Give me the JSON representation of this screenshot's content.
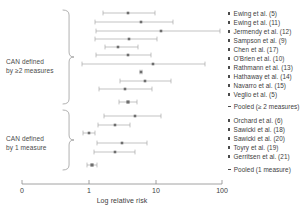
{
  "figure": {
    "axis": {
      "label": "Log relative risk",
      "ticks": [
        {
          "text": "0",
          "x": 22
        },
        {
          "text": "1",
          "x": 89
        },
        {
          "text": "10",
          "x": 156
        },
        {
          "text": "100",
          "x": 222
        }
      ],
      "line": {
        "x1": 22,
        "x2": 222,
        "y": 184
      },
      "tick_height": 4,
      "color": "#8a8a8a"
    },
    "groups": [
      {
        "id": "can-2-measures",
        "label": "CAN defined\nby ≥2 measures",
        "label_x": 6,
        "label_y": 58,
        "brace": {
          "x": 63,
          "y_top": 10,
          "y_bottom": 104,
          "width": 11
        }
      },
      {
        "id": "can-1-measure",
        "label": "CAN defined\nby 1 measure",
        "label_x": 6,
        "label_y": 135,
        "brace": {
          "x": 63,
          "y_top": 110,
          "y_bottom": 170,
          "width": 11
        }
      }
    ],
    "legend": [
      {
        "text": "Ewing et al. (5)",
        "y": 10,
        "type": "study"
      },
      {
        "text": "Ewing et al. (11)",
        "y": 19,
        "type": "study"
      },
      {
        "text": "Jermendy et al. (12)",
        "y": 28,
        "type": "study"
      },
      {
        "text": "Sampson et al. (9)",
        "y": 37,
        "type": "study"
      },
      {
        "text": "Chen et al. (17)",
        "y": 46,
        "type": "study"
      },
      {
        "text": "O'Brien et al. (10)",
        "y": 55,
        "type": "study"
      },
      {
        "text": "Rathmann et al. (13)",
        "y": 64,
        "type": "study"
      },
      {
        "text": "Hathaway et al. (14)",
        "y": 73,
        "type": "study"
      },
      {
        "text": "Navarro et al. (15)",
        "y": 82,
        "type": "study"
      },
      {
        "text": "Veglio et al. (5)",
        "y": 91,
        "type": "study"
      },
      {
        "text": "Pooled (≥ 2 measures)",
        "y": 103,
        "type": "pooled"
      },
      {
        "text": "Orchard et al. (6)",
        "y": 117,
        "type": "study"
      },
      {
        "text": "Sawicki et al. (18)",
        "y": 126,
        "type": "study"
      },
      {
        "text": "Sawicki et al. (20)",
        "y": 135,
        "type": "study"
      },
      {
        "text": "Toyry et al. (19)",
        "y": 144,
        "type": "study"
      },
      {
        "text": "Gerritsen et al. (21)",
        "y": 153,
        "type": "study"
      },
      {
        "text": "Pooled (1 measure)",
        "y": 166,
        "type": "pooled"
      }
    ]
  },
  "chart_data": {
    "type": "forest",
    "title": "",
    "xlabel": "Log relative risk",
    "ylabel": "",
    "xscale": "log",
    "xlim": [
      0,
      100
    ],
    "xticks": [
      0,
      1,
      10,
      100
    ],
    "grid": false,
    "legend_position": "right",
    "marker_color": "#6e6e6e",
    "line_color": "#9a9a9a",
    "rows": [
      {
        "label": "Ewing et al. (5)",
        "group": "can-2-measures",
        "y": 13,
        "estimate_px": 128,
        "low_px": 103,
        "high_px": 155,
        "estimate": 3.6,
        "low": 1.6,
        "high": 8.3
      },
      {
        "label": "Ewing et al. (11)",
        "group": "can-2-measures",
        "y": 22,
        "estimate_px": 141,
        "low_px": 95,
        "high_px": 173,
        "estimate": 5.9,
        "low": 1.3,
        "high": 16.2
      },
      {
        "label": "Jermendy et al. (12)",
        "group": "can-2-measures",
        "y": 31,
        "estimate_px": 161,
        "low_px": 96,
        "high_px": 220,
        "estimate": 12.5,
        "low": 1.3,
        "high": 94.0
      },
      {
        "label": "Sampson et al. (9)",
        "group": "can-2-measures",
        "y": 39,
        "estimate_px": 129,
        "low_px": 95,
        "high_px": 157,
        "estimate": 3.8,
        "low": 1.3,
        "high": 9.1
      },
      {
        "label": "Chen et al. (17)",
        "group": "can-2-measures",
        "y": 47,
        "estimate_px": 118,
        "low_px": 105,
        "high_px": 138,
        "estimate": 2.6,
        "low": 1.8,
        "high": 5.3
      },
      {
        "label": "O'Brien et al. (10)",
        "group": "can-2-measures",
        "y": 55,
        "estimate_px": 128,
        "low_px": 96,
        "high_px": 151,
        "estimate": 3.6,
        "low": 1.3,
        "high": 7.5
      },
      {
        "label": "Rathmann et al. (13)",
        "group": "can-2-measures",
        "y": 64,
        "estimate_px": 153,
        "low_px": 82,
        "high_px": 205,
        "estimate": 9.5,
        "low": 0.8,
        "high": 55.0
      },
      {
        "label": "Hathaway et al. (14)",
        "group": "can-2-measures",
        "y": 72,
        "estimate_px": 141,
        "low_px": 140,
        "high_px": 142,
        "estimate": 5.9,
        "low": 5.8,
        "high": 6.0
      },
      {
        "label": "Navarro et al. (15)",
        "group": "can-2-measures",
        "y": 81,
        "estimate_px": 145,
        "low_px": 120,
        "high_px": 171,
        "estimate": 6.9,
        "low": 2.9,
        "high": 15.3
      },
      {
        "label": "Veglio et al. (5)",
        "group": "can-2-measures",
        "y": 89,
        "estimate_px": 125,
        "low_px": 99,
        "high_px": 152,
        "estimate": 3.2,
        "low": 1.4,
        "high": 7.8
      },
      {
        "label": "Pooled (≥ 2 measures)",
        "group": "can-2-measures",
        "y": 102,
        "estimate_px": 128,
        "low_px": 119,
        "high_px": 137,
        "estimate": 3.6,
        "low": 2.8,
        "high": 5.2,
        "pooled": true
      },
      {
        "label": "Orchard et al. (6)",
        "group": "can-1-measure",
        "y": 116,
        "estimate_px": 135,
        "low_px": 104,
        "high_px": 161,
        "estimate": 4.7,
        "low": 1.7,
        "high": 11.0
      },
      {
        "label": "Sawicki et al. (18)",
        "group": "can-1-measure",
        "y": 125,
        "estimate_px": 115,
        "low_px": 98,
        "high_px": 130,
        "estimate": 2.4,
        "low": 1.4,
        "high": 3.8
      },
      {
        "label": "Sawicki et al. (20)",
        "group": "can-1-measure",
        "y": 133,
        "estimate_px": 89,
        "low_px": 83,
        "high_px": 95,
        "estimate": 1.0,
        "low": 0.8,
        "high": 1.2
      },
      {
        "label": "Toyry et al. (19)",
        "group": "can-1-measure",
        "y": 143,
        "estimate_px": 122,
        "low_px": 97,
        "high_px": 147,
        "estimate": 3.0,
        "low": 1.3,
        "high": 7.0
      },
      {
        "label": "Gerritsen et al. (21)",
        "group": "can-1-measure",
        "y": 152,
        "estimate_px": 115,
        "low_px": 94,
        "high_px": 135,
        "estimate": 2.4,
        "low": 1.2,
        "high": 4.7
      },
      {
        "label": "Pooled (1 measure)",
        "group": "can-1-measure",
        "y": 165,
        "estimate_px": 92,
        "low_px": 87,
        "high_px": 97,
        "estimate": 1.1,
        "low": 0.95,
        "high": 1.3,
        "pooled": true
      }
    ]
  }
}
